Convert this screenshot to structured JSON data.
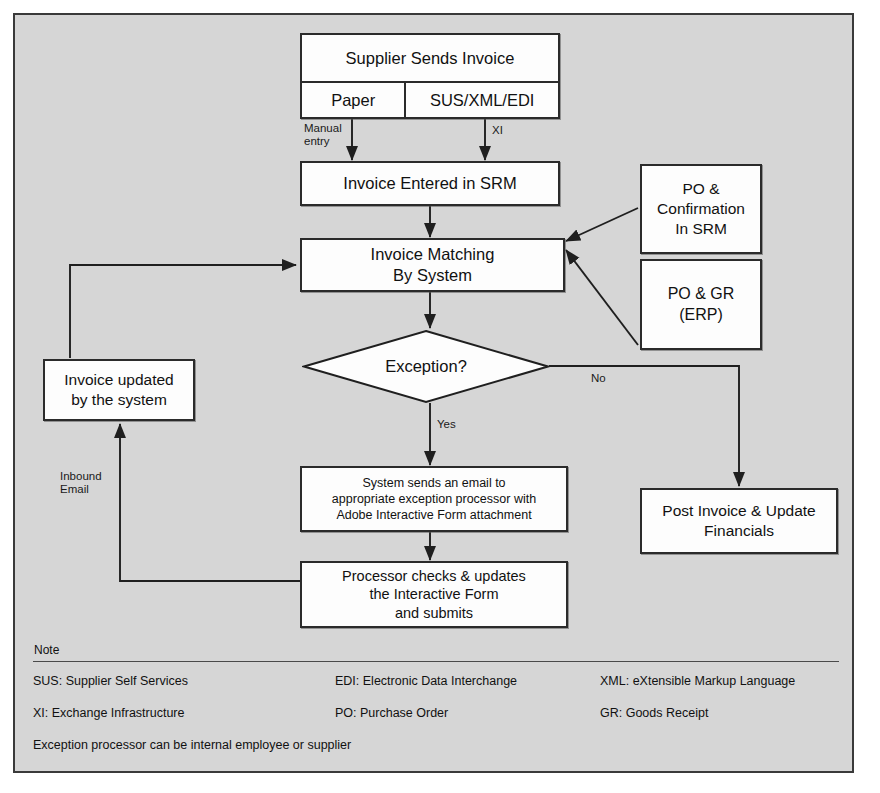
{
  "diagram": {
    "background_color": "#d6d6d6",
    "node_fill": "#fdfdfd",
    "line_color": "#2b2b2b",
    "nodes": {
      "supplier": {
        "header": "Supplier Sends Invoice",
        "channel_paper": "Paper",
        "channel_electronic": "SUS/XML/EDI"
      },
      "invoice_entered": "Invoice Entered in SRM",
      "invoice_matching": "Invoice Matching\nBy System",
      "invoice_matching_line1": "Invoice Matching",
      "invoice_matching_line2": "By System",
      "po_confirmation_line1": "PO &",
      "po_confirmation_line2": "Confirmation",
      "po_confirmation_line3": "In SRM",
      "po_gr_line1": "PO & GR",
      "po_gr_line2": "(ERP)",
      "exception_decision": "Exception?",
      "invoice_updated_line1": "Invoice updated",
      "invoice_updated_line2": "by the system",
      "system_email_line1": "System sends an email to",
      "system_email_line2": "appropriate exception processor with",
      "system_email_line3": "Adobe Interactive Form attachment",
      "processor_line1": "Processor checks & updates",
      "processor_line2": "the Interactive Form",
      "processor_line3": "and submits",
      "post_invoice_line1": "Post Invoice & Update",
      "post_invoice_line2": "Financials"
    },
    "edge_labels": {
      "manual_entry": "Manual\nentry",
      "xi": "XI",
      "yes": "Yes",
      "no": "No",
      "inbound_email": "Inbound\nEmail"
    }
  },
  "note": {
    "title": "Note",
    "entries": [
      {
        "col1": "SUS: Supplier Self Services",
        "col2": "EDI: Electronic Data Interchange",
        "col3": "XML: eXtensible Markup Language"
      },
      {
        "col1": "XI: Exchange Infrastructure",
        "col2": "PO: Purchase Order",
        "col3": "GR: Goods Receipt"
      }
    ],
    "footer": "Exception processor can be internal employee or supplier"
  }
}
